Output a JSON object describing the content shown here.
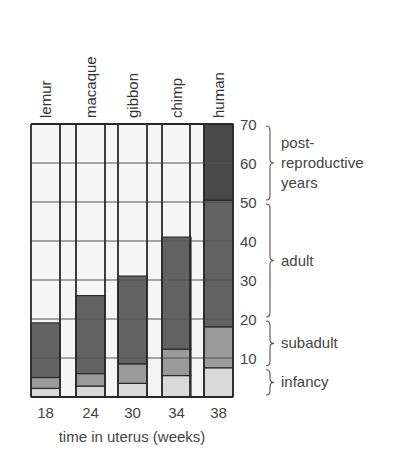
{
  "chart_data": {
    "type": "bar",
    "stacked": true,
    "title": "",
    "xlabel": "time in uterus (weeks)",
    "ylabel": "",
    "ylim": [
      0,
      70
    ],
    "yticks": [
      10,
      20,
      30,
      40,
      50,
      60,
      70
    ],
    "grid": true,
    "categories": [
      "lemur",
      "macaque",
      "gibbon",
      "chimp",
      "human"
    ],
    "x_tick_labels": [
      "18",
      "24",
      "30",
      "34",
      "38"
    ],
    "series": [
      {
        "name": "infancy",
        "color": "#d9d9d9",
        "values": [
          2.2,
          2.8,
          3.5,
          5.5,
          7.5
        ]
      },
      {
        "name": "subadult",
        "color": "#9a9a9a",
        "values": [
          2.8,
          3.2,
          5.0,
          6.8,
          10.5
        ]
      },
      {
        "name": "adult",
        "color": "#626262",
        "values": [
          14.0,
          20.0,
          22.5,
          28.7,
          32.5
        ]
      },
      {
        "name": "post-reproductive years",
        "color": "#484848",
        "values": [
          0,
          0,
          0,
          0,
          19.5
        ]
      }
    ],
    "cumulative_tops": {
      "lemur": [
        2.2,
        5,
        19
      ],
      "macaque": [
        2.8,
        6,
        26
      ],
      "gibbon": [
        3.5,
        8.5,
        31
      ],
      "chimp": [
        5.5,
        12.3,
        41
      ],
      "human": [
        7.5,
        18,
        50.5,
        70
      ]
    },
    "stage_brackets": [
      {
        "label_lines": [
          "post-",
          "reproductive",
          "years"
        ],
        "from": 50,
        "to": 70
      },
      {
        "label_lines": [
          "adult"
        ],
        "from": 20,
        "to": 50
      },
      {
        "label_lines": [
          "subadult"
        ],
        "from": 7.5,
        "to": 20
      },
      {
        "label_lines": [
          "infancy"
        ],
        "from": 0,
        "to": 7.5
      }
    ],
    "legend": "bracket annotations on right side",
    "colors": {
      "empty": "#f5f5f5",
      "frame": "#2a2a2a",
      "grid": "#555555"
    }
  }
}
